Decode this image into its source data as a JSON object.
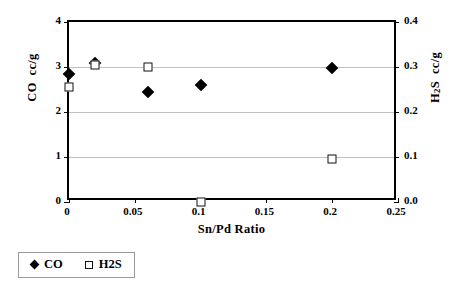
{
  "chart_data": {
    "type": "scatter",
    "title": "",
    "xlabel": "Sn/Pd Ratio",
    "ylabel": "CO  cc/g",
    "y2label": "H2S  cc/g",
    "xlim": [
      0,
      0.25
    ],
    "ylim": [
      0,
      4
    ],
    "y2lim": [
      0,
      0.4
    ],
    "grid": "horizontal",
    "legend_position": "below-left",
    "x_ticks": [
      "0",
      "0.05",
      "0.1",
      "0.15",
      "0.2",
      "0.25"
    ],
    "x_tick_values": [
      0,
      0.05,
      0.1,
      0.15,
      0.2,
      0.25
    ],
    "y_ticks": [
      "0",
      "1",
      "2",
      "3",
      "4"
    ],
    "y_tick_values": [
      0,
      1,
      2,
      3,
      4
    ],
    "y2_ticks": [
      "0.0",
      "0.1",
      "0.2",
      "0.3",
      "0.4"
    ],
    "y2_tick_values": [
      0,
      0.1,
      0.2,
      0.3,
      0.4
    ],
    "series": [
      {
        "name": "CO",
        "axis": "left",
        "marker": "filled-diamond",
        "color": "#000000",
        "points": [
          {
            "x": 0,
            "y": 2.85
          },
          {
            "x": 0.02,
            "y": 3.1
          },
          {
            "x": 0.06,
            "y": 2.45
          },
          {
            "x": 0.1,
            "y": 2.6
          },
          {
            "x": 0.2,
            "y": 2.97
          }
        ]
      },
      {
        "name": "H2S",
        "axis": "right",
        "marker": "open-square",
        "color": "#111111",
        "points": [
          {
            "x": 0,
            "y": 0.255
          },
          {
            "x": 0.02,
            "y": 0.305
          },
          {
            "x": 0.06,
            "y": 0.3
          },
          {
            "x": 0.1,
            "y": 0.0
          },
          {
            "x": 0.2,
            "y": 0.095
          }
        ]
      }
    ]
  },
  "axes": {
    "y_left_title_main": "CO",
    "y_left_title_unit": "cc/g",
    "y_right_title_main_a": "H",
    "y_right_title_sub": "2",
    "y_right_title_main_b": "S",
    "y_right_title_unit": "cc/g",
    "x_title": "Sn/Pd Ratio"
  },
  "legend": {
    "items": [
      {
        "label": "CO",
        "marker": "filled-diamond"
      },
      {
        "label": "H2S",
        "marker": "open-square"
      }
    ]
  }
}
